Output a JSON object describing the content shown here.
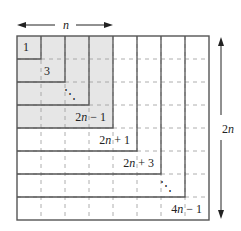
{
  "diagram": {
    "grid": {
      "cols": 8,
      "rows": 8,
      "x0": 17,
      "y0": 36,
      "cell_w": 24,
      "cell_h": 23
    },
    "shaded_block": 4,
    "colors": {
      "shade": "#e6e6e6",
      "line": "#555555",
      "dash": "#9a9a9a",
      "text": "#222222"
    },
    "top_dimension": {
      "label": "n",
      "arrow": "double-headed horizontal"
    },
    "right_dimension": {
      "label": "2n",
      "arrow": "double-headed vertical"
    },
    "l_labels": [
      {
        "text": "1",
        "x": 29,
        "y": 51
      },
      {
        "text": "3",
        "x": 50,
        "y": 75
      },
      {
        "text": "⋱",
        "x": 76,
        "y": 98
      },
      {
        "text": "2n − 1",
        "x": 106,
        "y": 121,
        "italic_n": true
      },
      {
        "text": "2n + 1",
        "x": 130,
        "y": 144,
        "italic_n": true
      },
      {
        "text": "2n + 3",
        "x": 154,
        "y": 167,
        "italic_n": true
      },
      {
        "text": "⋱",
        "x": 172,
        "y": 190
      },
      {
        "text": "4n − 1",
        "x": 202,
        "y": 213,
        "italic_n": true
      }
    ]
  }
}
